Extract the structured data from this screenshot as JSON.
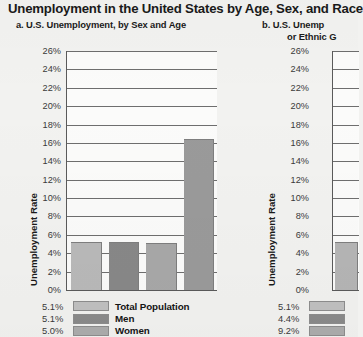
{
  "figure": {
    "title": "Unemployment in the United States by Age, Sex, and Race",
    "background_color": "#f2f2f0"
  },
  "panel_a": {
    "label": "a.  U.S. Unemployment, by Sex and Age"
  },
  "panel_b": {
    "label": "b.  U.S. Unemp",
    "label_line2": "or Ethnic G"
  },
  "chart_data": [
    {
      "id": "chart-a",
      "type": "bar",
      "title": "a.  U.S. Unemployment, by Sex and Age",
      "xlabel": "",
      "ylabel": "Unemployment Rate",
      "ylim": [
        0,
        26
      ],
      "ytick_labels": [
        "26%",
        "24%",
        "22%",
        "20%",
        "18%",
        "16%",
        "14%",
        "12%",
        "10%",
        "8%",
        "6%",
        "4%",
        "2%",
        "0%"
      ],
      "ytick_values": [
        26,
        24,
        22,
        20,
        18,
        16,
        14,
        12,
        10,
        8,
        6,
        4,
        2,
        0
      ],
      "grid": true,
      "legend_position": "below",
      "categories": [
        "Total Population",
        "Men",
        "Women",
        "Teenagers"
      ],
      "values": [
        5.1,
        5.1,
        5.0,
        16.3
      ],
      "value_labels": [
        "5.1%",
        "5.1%",
        "5.0%",
        "16.3%"
      ],
      "bar_colors": [
        "#b9b9b9",
        "#888888",
        "#a8a8a8",
        "#9a9a9a"
      ],
      "legend": [
        {
          "value": "5.1%",
          "label": "Total Population",
          "color": "#c0c0c0"
        },
        {
          "value": "5.1%",
          "label": "Men",
          "color": "#8a8a8a"
        },
        {
          "value": "5.0%",
          "label": "Women",
          "color": "#acacac"
        }
      ]
    },
    {
      "id": "chart-b",
      "type": "bar",
      "title": "b.  U.S. Unemp... or Ethnic G...",
      "xlabel": "",
      "ylabel": "Unemployment Rate",
      "ylim": [
        0,
        26
      ],
      "ytick_labels": [
        "26%",
        "24%",
        "22%",
        "20%",
        "18%",
        "16%",
        "14%",
        "12%",
        "10%",
        "8%",
        "6%",
        "4%",
        "2%",
        "0%"
      ],
      "ytick_values": [
        26,
        24,
        22,
        20,
        18,
        16,
        14,
        12,
        10,
        8,
        6,
        4,
        2,
        0
      ],
      "grid": true,
      "legend_position": "below",
      "categories": [
        "White"
      ],
      "values": [
        5.1
      ],
      "value_labels": [
        "5.1%"
      ],
      "bar_colors": [
        "#b5b5b5"
      ],
      "legend": [
        {
          "value": "5.1%",
          "label": "",
          "color": "#c0c0c0"
        },
        {
          "value": "4.4%",
          "label": "",
          "color": "#8a8a8a"
        },
        {
          "value": "9.2%",
          "label": "",
          "color": "#acacac"
        }
      ]
    }
  ]
}
